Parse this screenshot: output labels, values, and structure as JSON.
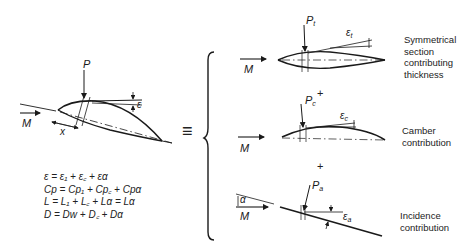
{
  "diagram": {
    "main_airfoil": {
      "labels": {
        "force": "P",
        "flow": "M",
        "position": "x",
        "angle": "ε"
      }
    },
    "equivalence_symbol": "≡",
    "equations": [
      "ε = ε₁ + ε꜀ + εα",
      "Cp = Cp₁ + Cp꜀ + Cpα",
      "L = L₁ + L꜀ + Lα = Lα",
      "D = Dw + D꜀ + Dα"
    ],
    "components": [
      {
        "force_label": "P",
        "force_subscript": "t",
        "angle_label": "ε",
        "angle_subscript": "t",
        "flow_label": "M",
        "caption": [
          "Symmetrical",
          "section",
          "contributing",
          "thickness"
        ]
      },
      {
        "force_label": "P",
        "force_subscript": "c",
        "angle_label": "ε",
        "angle_subscript": "c",
        "flow_label": "M",
        "caption": [
          "Camber",
          "contribution"
        ]
      },
      {
        "force_label": "P",
        "force_subscript": "a",
        "angle_label": "ε",
        "angle_subscript": "a",
        "flow_label": "M",
        "incidence_label": "α",
        "caption": [
          "Incidence",
          "contribution"
        ]
      }
    ],
    "plus_signs": [
      "+",
      "+"
    ],
    "stroke_color": "#1a1a1a"
  }
}
